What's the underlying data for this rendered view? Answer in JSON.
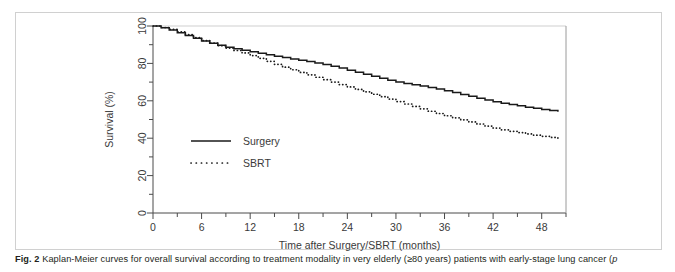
{
  "figure": {
    "caption_label": "Fig. 2",
    "caption_text": "Kaplan-Meier curves for overall survival according to treatment modality in very elderly (≥80 years) patients with early-stage lung cancer (",
    "caption_italic_tail": "p",
    "border_color": "#d0d0d0"
  },
  "chart_data": {
    "type": "line",
    "title": "",
    "subtitle": "",
    "xlabel": "Time after Surgery/SBRT (months)",
    "ylabel": "Survival (%)",
    "xlim": [
      0,
      51
    ],
    "ylim": [
      0,
      100
    ],
    "grid": false,
    "legend_position": "inside-left",
    "x_ticks": [
      0,
      6,
      12,
      18,
      24,
      30,
      36,
      42,
      48
    ],
    "x_tick_labels": [
      "0",
      "6",
      "12",
      "18",
      "24",
      "30",
      "36",
      "42",
      "48"
    ],
    "x_minor_ticks": [
      3,
      9,
      15,
      21,
      27,
      33,
      39,
      45,
      51
    ],
    "y_ticks": [
      0,
      20,
      40,
      60,
      80,
      100
    ],
    "y_tick_labels": [
      "0",
      "20",
      "40",
      "60",
      "80",
      "100"
    ],
    "y_minor_ticks": [
      10,
      30,
      50,
      70,
      90
    ],
    "series": [
      {
        "name": "Surgery",
        "style": "solid",
        "color": "#1a1a1a",
        "x": [
          0,
          1,
          2,
          3,
          4,
          5,
          6,
          7,
          8,
          9,
          10,
          11,
          12,
          13,
          14,
          15,
          16,
          17,
          18,
          19,
          20,
          21,
          22,
          23,
          24,
          25,
          26,
          27,
          28,
          29,
          30,
          31,
          32,
          33,
          34,
          35,
          36,
          37,
          38,
          39,
          40,
          41,
          42,
          43,
          44,
          45,
          46,
          47,
          48,
          49,
          50
        ],
        "values": [
          100,
          99.0,
          97.8,
          96.4,
          94.9,
          93.4,
          92.0,
          90.8,
          89.7,
          88.7,
          87.8,
          87.0,
          86.2,
          85.4,
          84.6,
          83.8,
          83.1,
          82.4,
          81.7,
          81.0,
          80.2,
          79.4,
          78.5,
          77.5,
          76.4,
          75.3,
          74.2,
          73.1,
          72.0,
          71.0,
          70.1,
          69.3,
          68.6,
          67.9,
          67.1,
          66.3,
          65.4,
          64.4,
          63.4,
          62.4,
          61.4,
          60.4,
          59.5,
          58.7,
          58.0,
          57.3,
          56.6,
          56.0,
          55.4,
          54.8,
          54.2
        ]
      },
      {
        "name": "SBRT",
        "style": "dotted",
        "color": "#1a1a1a",
        "x": [
          0,
          1,
          2,
          3,
          4,
          5,
          6,
          7,
          8,
          9,
          10,
          11,
          12,
          13,
          14,
          15,
          16,
          17,
          18,
          19,
          20,
          21,
          22,
          23,
          24,
          25,
          26,
          27,
          28,
          29,
          30,
          31,
          32,
          33,
          34,
          35,
          36,
          37,
          38,
          39,
          40,
          41,
          42,
          43,
          44,
          45,
          46,
          47,
          48,
          49,
          50
        ],
        "values": [
          100,
          99.2,
          98.2,
          96.9,
          95.4,
          93.8,
          92.2,
          90.8,
          89.5,
          88.2,
          86.9,
          85.6,
          84.2,
          82.7,
          81.1,
          79.5,
          78.0,
          76.6,
          75.2,
          73.9,
          72.6,
          71.3,
          70.0,
          68.7,
          67.4,
          66.1,
          64.8,
          63.5,
          62.2,
          60.9,
          59.6,
          58.3,
          57.0,
          55.7,
          54.4,
          53.2,
          52.0,
          50.9,
          49.8,
          48.7,
          47.6,
          46.5,
          45.4,
          44.5,
          43.7,
          43.0,
          42.3,
          41.6,
          41.0,
          40.4,
          39.9
        ]
      }
    ],
    "legend": [
      {
        "label": "Surgery",
        "style": "solid"
      },
      {
        "label": "SBRT",
        "style": "dotted"
      }
    ]
  }
}
